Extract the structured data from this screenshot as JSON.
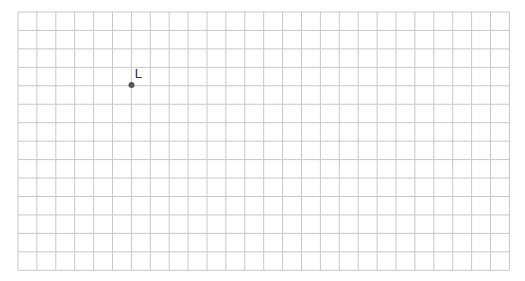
{
  "grid": {
    "left": 18,
    "top": 12,
    "cols": 26,
    "rows": 14,
    "cell_w": 18.9,
    "cell_h": 18.45,
    "line_color": "#c8c8c8",
    "background": "#ffffff"
  },
  "points": [
    {
      "label": "L",
      "x": 131.5,
      "y": 85,
      "color": "#555555"
    }
  ]
}
